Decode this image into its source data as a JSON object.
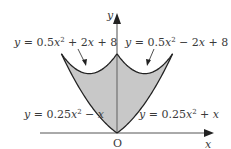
{
  "diagram": {
    "axes": {
      "x_label": "x",
      "y_label": "y",
      "origin_label": "O"
    },
    "curves": [
      {
        "id": "upper-left",
        "label_prefix": "y = 0.5",
        "label_var": "x",
        "label_exp": "2",
        "label_rest": " + 2",
        "label_rest_var": "x",
        "label_tail": " + 8",
        "a": 0.5,
        "b": 2,
        "c": 8,
        "domain": [
          -4,
          0
        ]
      },
      {
        "id": "upper-right",
        "label_prefix": "y = 0.5",
        "label_var": "x",
        "label_exp": "2",
        "label_rest": " − 2",
        "label_rest_var": "x",
        "label_tail": " + 8",
        "a": 0.5,
        "b": -2,
        "c": 8,
        "domain": [
          0,
          4
        ]
      },
      {
        "id": "lower-left",
        "label_prefix": "y = 0.25",
        "label_var": "x",
        "label_exp": "2",
        "label_rest": " − ",
        "label_rest_var": "x",
        "label_tail": "",
        "a": 0.25,
        "b": -1,
        "c": 0,
        "domain": [
          -4,
          0
        ]
      },
      {
        "id": "lower-right",
        "label_prefix": "y = 0.25",
        "label_var": "x",
        "label_exp": "2",
        "label_rest": " + ",
        "label_rest_var": "x",
        "label_tail": "",
        "a": 0.25,
        "b": 1,
        "c": 0,
        "domain": [
          0,
          4
        ]
      }
    ],
    "colors": {
      "fill": "#c8c8c8",
      "stroke": "#222222",
      "axis": "#555555",
      "text": "#3a3a3a"
    }
  }
}
